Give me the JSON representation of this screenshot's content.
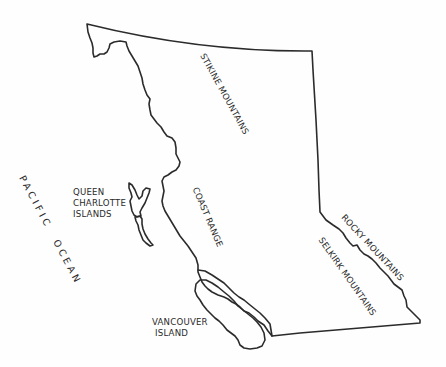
{
  "map": {
    "region": "British Columbia",
    "colors": {
      "background": "#fefefe",
      "outline": "#2b2b2b",
      "text": "#2a2a2a"
    },
    "labels": {
      "stikine": "STIKINE MOUNTAINS",
      "coast_range": "COAST RANGE",
      "rocky": "ROCKY MOUNTAINS",
      "selkirk": "SELKIRK MOUNTAINS",
      "queen_charlotte_1": "QUEEN",
      "queen_charlotte_2": "CHARLOTTE",
      "queen_charlotte_3": "ISLANDS",
      "vancouver_1": "VANCOUVER",
      "vancouver_2": "ISLAND",
      "pacific": "PACIFIC",
      "ocean": "OCEAN"
    }
  }
}
